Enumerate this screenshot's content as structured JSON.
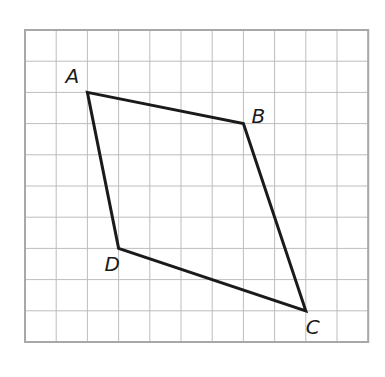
{
  "diagram": {
    "type": "quadrilateral-on-grid",
    "grid": {
      "origin_px": [
        25,
        30
      ],
      "cell_px": 31.2,
      "cols": 11,
      "rows": 10,
      "line_color": "#bdbdbd",
      "border_color": "#a8a8a8"
    },
    "shape": {
      "stroke_color": "#1a1a1a",
      "stroke_width": 3,
      "order": [
        "A",
        "B",
        "C",
        "D"
      ]
    },
    "vertices": [
      {
        "name": "A",
        "grid": [
          2,
          2
        ],
        "label_offset": [
          -22,
          -26
        ]
      },
      {
        "name": "B",
        "grid": [
          7,
          3
        ],
        "label_offset": [
          8,
          -18
        ]
      },
      {
        "name": "C",
        "grid": [
          9,
          9
        ],
        "label_offset": [
          0,
          6
        ]
      },
      {
        "name": "D",
        "grid": [
          3,
          7
        ],
        "label_offset": [
          -14,
          6
        ]
      }
    ]
  }
}
